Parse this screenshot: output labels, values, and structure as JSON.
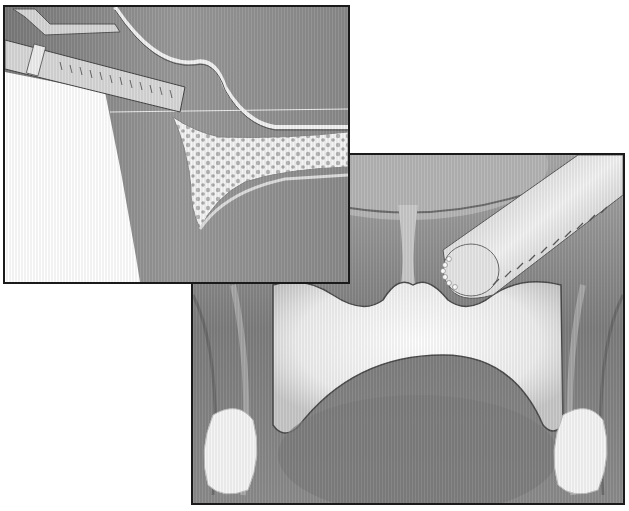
{
  "figure": {
    "type": "medical-illustration",
    "style": "grayscale pencil/airbrush shading",
    "panels": [
      {
        "id": "inset-cross-section",
        "position": "top-left",
        "content": [
          "surgical instrument shaft with clamp",
          "curved membrane line",
          "cancellous bone cross-section (porous)",
          "soft tissue folds"
        ]
      },
      {
        "id": "main-view",
        "position": "bottom-right",
        "content": [
          "cylindrical burr/drill tip with fine teeth",
          "central white bony plate with two arched notches",
          "midline septum",
          "lateral tissue folds",
          "two white rounded structures at lower corners"
        ]
      }
    ],
    "colors": {
      "frame": "#1a1a1a",
      "tissue_dark": "#6e6e6e",
      "tissue_mid": "#9a9a9a",
      "bone_light": "#f2f2f2",
      "background": "#ffffff"
    }
  }
}
